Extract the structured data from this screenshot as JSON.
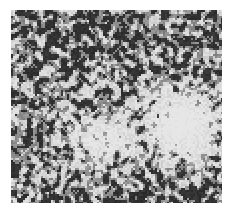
{
  "image": {
    "kind": "random-dot noise texture",
    "background_color": "#ffffff",
    "frame": {
      "x": 11,
      "y": 10,
      "width": 211,
      "height": 193
    },
    "dark_color": "#1e1e1e",
    "light_color": "#e6e6e6",
    "grain_size": 2,
    "density_dark": 0.5,
    "light_regions": [
      {
        "name": "right-bright-patch",
        "cx": 170,
        "cy": 115,
        "rx": 38,
        "ry": 40,
        "strength": 0.85
      },
      {
        "name": "center-left-bright-patch",
        "cx": 90,
        "cy": 130,
        "rx": 42,
        "ry": 32,
        "strength": 0.5
      }
    ],
    "dark_regions": [
      {
        "name": "top-dark-band",
        "cx": 105,
        "cy": 20,
        "rx": 110,
        "ry": 30,
        "strength": 0.25
      },
      {
        "name": "bottom-dark-band",
        "cx": 100,
        "cy": 190,
        "rx": 110,
        "ry": 25,
        "strength": 0.25
      }
    ]
  }
}
